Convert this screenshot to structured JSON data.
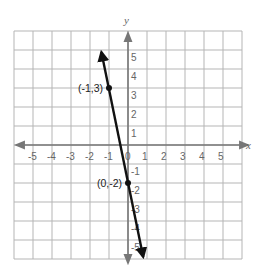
{
  "chart_data": {
    "type": "line",
    "title": "",
    "xlabel": "x",
    "ylabel": "y",
    "xlim": [
      -6,
      6
    ],
    "ylim": [
      -6,
      6
    ],
    "grid": true,
    "x_ticks": [
      -5,
      -4,
      -3,
      -2,
      -1,
      0,
      1,
      2,
      3,
      4,
      5
    ],
    "y_ticks": [
      5,
      4,
      3,
      2,
      1,
      -1,
      -2,
      -3,
      -4,
      -5
    ],
    "x_tick_labels": [
      "-5",
      "-4",
      "-3",
      "-2",
      "-1",
      "0",
      "1",
      "2",
      "3",
      "4",
      "5"
    ],
    "y_tick_labels": [
      "5",
      "4",
      "3",
      "2",
      "1",
      "-1",
      "-2",
      "-3",
      "-4",
      "-5"
    ],
    "series": [
      {
        "name": "y = -5x - 2",
        "slope": -5,
        "intercept": -2,
        "x": [
          -1.4,
          0.8
        ],
        "y": [
          5.0,
          -6.0
        ],
        "arrows_both_ends": true
      }
    ],
    "points": [
      {
        "x": -1,
        "y": 3,
        "label": "(-1,3)"
      },
      {
        "x": 0,
        "y": -2,
        "label": "(0,-2)"
      }
    ]
  },
  "colors": {
    "grid": "#b5b5b5",
    "axis": "#777777",
    "line": "#111111"
  }
}
